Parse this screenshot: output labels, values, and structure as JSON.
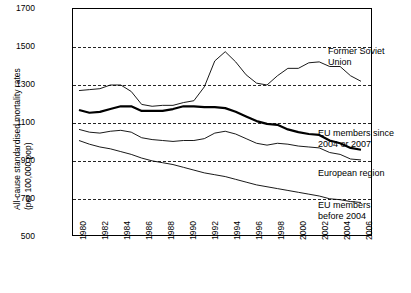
{
  "chart_data": {
    "type": "line",
    "title": "",
    "xlabel": "",
    "ylabel": "All-cause standardised mortality rates (per 100,000 pop)",
    "ylabel_line1": "All-cause standardised mortality rates",
    "ylabel_line2": "(per 100,000 pop)",
    "ylim": [
      500,
      1700
    ],
    "yticks": [
      500,
      700,
      900,
      1100,
      1300,
      1500,
      1700
    ],
    "xlim": [
      1980,
      2007
    ],
    "xticks": [
      1980,
      1982,
      1984,
      1986,
      1988,
      1990,
      1992,
      1994,
      1996,
      1998,
      2000,
      2002,
      2004,
      2006
    ],
    "x": [
      1980,
      1981,
      1982,
      1983,
      1984,
      1985,
      1986,
      1987,
      1988,
      1989,
      1990,
      1991,
      1992,
      1993,
      1994,
      1995,
      1996,
      1997,
      1998,
      1999,
      2000,
      2001,
      2002,
      2003,
      2004,
      2005,
      2006,
      2007
    ],
    "grid": "horizontal-dashed",
    "legend": "inline-annotations",
    "series": [
      {
        "name": "Former Soviet Union",
        "values": [
          1270,
          1275,
          1280,
          1300,
          1300,
          1265,
          1195,
          1185,
          1190,
          1190,
          1205,
          1215,
          1290,
          1430,
          1480,
          1425,
          1355,
          1310,
          1300,
          1350,
          1390,
          1390,
          1420,
          1425,
          1400,
          1400,
          1350,
          1320
        ]
      },
      {
        "name": "EU members since 2004 or 2007",
        "values": [
          1165,
          1150,
          1155,
          1170,
          1185,
          1185,
          1160,
          1160,
          1160,
          1170,
          1185,
          1185,
          1180,
          1180,
          1175,
          1155,
          1130,
          1105,
          1090,
          1085,
          1060,
          1045,
          1035,
          1030,
          1000,
          985,
          960,
          950
        ]
      },
      {
        "name": "European region",
        "values": [
          1060,
          1045,
          1040,
          1050,
          1055,
          1045,
          1015,
          1005,
          1000,
          995,
          1000,
          1000,
          1010,
          1040,
          1050,
          1035,
          1010,
          985,
          975,
          985,
          980,
          970,
          965,
          960,
          935,
          925,
          900,
          895
        ]
      },
      {
        "name": "EU members before 2004",
        "values": [
          1000,
          980,
          965,
          955,
          940,
          925,
          905,
          890,
          880,
          870,
          855,
          840,
          825,
          815,
          805,
          790,
          775,
          760,
          750,
          740,
          730,
          720,
          710,
          700,
          685,
          680,
          670,
          665
        ]
      }
    ],
    "annotations": [
      {
        "text_line1": "Former Soviet",
        "text_line2": "Union"
      },
      {
        "text_line1": "EU members since",
        "text_line2": "2004 or 2007"
      },
      {
        "text_line1": "European region",
        "text_line2": ""
      },
      {
        "text_line1": "EU members",
        "text_line2": "before 2004"
      }
    ]
  }
}
